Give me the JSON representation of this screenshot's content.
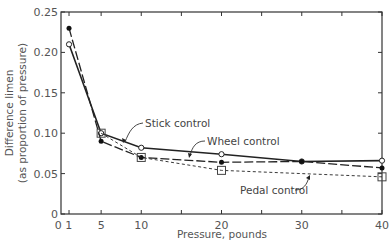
{
  "chart_data": {
    "type": "line",
    "title": "",
    "xlabel": "Pressure, pounds",
    "ylabel_line1": "Difference limen",
    "ylabel_line2": "(as proportion of pressure)",
    "xlim": [
      0,
      40
    ],
    "ylim": [
      0,
      0.25
    ],
    "grid": false,
    "legend": "inline annotations with arrows",
    "x_ticks": [
      1,
      5,
      10,
      20,
      30,
      40
    ],
    "x_tick_labels": [
      "0 1",
      "5",
      "10",
      "20",
      "30",
      "40"
    ],
    "x_minor_ticks": [
      15,
      25,
      35
    ],
    "y_ticks": [
      0,
      0.05,
      0.1,
      0.15,
      0.2,
      0.25
    ],
    "y_tick_labels": [
      "0",
      "0.05",
      "0.10",
      "0.15",
      "0.20",
      "0.25"
    ],
    "series": [
      {
        "name": "Stick control",
        "marker": "open-circle",
        "line": "solid",
        "x": [
          1,
          5,
          10,
          20,
          30,
          40
        ],
        "values": [
          0.21,
          0.1,
          0.082,
          0.074,
          0.065,
          0.066
        ]
      },
      {
        "name": "Wheel control",
        "marker": "filled-circle",
        "line": "long-dash",
        "x": [
          1,
          5,
          10,
          20,
          30,
          40
        ],
        "values": [
          0.23,
          0.09,
          0.07,
          0.064,
          0.065,
          0.057
        ]
      },
      {
        "name": "Pedal control",
        "marker": "open-square",
        "line": "short-dash",
        "x": [
          5,
          10,
          20,
          40
        ],
        "values": [
          0.1,
          0.07,
          0.054,
          0.046
        ]
      }
    ],
    "annotations": [
      {
        "text": "Stick control",
        "x": 145,
        "y": 127
      },
      {
        "text": "Wheel control",
        "x": 207,
        "y": 145
      },
      {
        "text": "Pedal control",
        "x": 240,
        "y": 194
      }
    ]
  }
}
